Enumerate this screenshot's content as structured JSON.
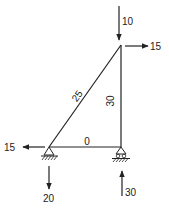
{
  "diagram": {
    "type": "truss",
    "stroke_color": "#222222",
    "nodes": {
      "left_support": {
        "x": 49,
        "y": 147,
        "support": "pin"
      },
      "right_support": {
        "x": 121,
        "y": 147,
        "support": "roller"
      },
      "top": {
        "x": 121,
        "y": 45
      }
    },
    "members": [
      {
        "id": "diagonal",
        "from": "left_support",
        "to": "top",
        "force_label": "25",
        "state": "compression"
      },
      {
        "id": "vertical",
        "from": "right_support",
        "to": "top",
        "force_label": "30",
        "state": "tension"
      },
      {
        "id": "bottom",
        "from": "left_support",
        "to": "right_support",
        "force_label": "0",
        "state": "zero"
      }
    ],
    "loads": [
      {
        "id": "top_vertical_load",
        "node": "top",
        "direction": "down",
        "label": "10"
      },
      {
        "id": "top_horizontal_load",
        "node": "top",
        "direction": "right",
        "label": "15"
      },
      {
        "id": "left_horizontal_reaction",
        "node": "left_support",
        "direction": "left",
        "label": "15"
      },
      {
        "id": "left_vertical_reaction",
        "node": "left_support",
        "direction": "down",
        "label": "20"
      },
      {
        "id": "right_vertical_reaction",
        "node": "right_support",
        "direction": "up",
        "label": "30"
      }
    ]
  }
}
